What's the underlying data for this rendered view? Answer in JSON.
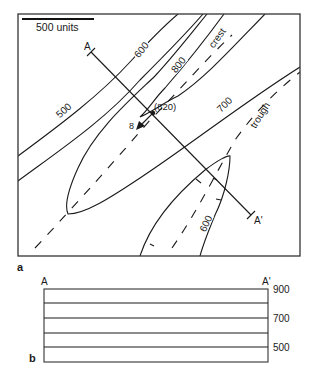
{
  "panel_a": {
    "label": "a",
    "scale_bar": {
      "label": "500 units"
    },
    "section_line": {
      "start_label": "A",
      "end_label": "A'"
    },
    "contours": [
      {
        "label": "500"
      },
      {
        "label": "600"
      },
      {
        "label": "800"
      },
      {
        "label": "700"
      },
      {
        "label": "600",
        "position": "lower closed contour"
      }
    ],
    "axis_labels": {
      "crest": "crest",
      "trough": "trough"
    },
    "plunge": {
      "value": "8",
      "spot_elevation": "(820)"
    }
  },
  "panel_b": {
    "label": "b",
    "start_label": "A",
    "end_label": "A'",
    "elevation_labels": [
      "900",
      "700",
      "500"
    ]
  }
}
